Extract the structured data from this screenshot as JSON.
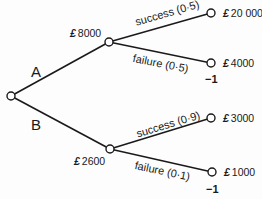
{
  "diagram": {
    "type": "decision-tree",
    "root": {
      "id": "decision",
      "x": 11,
      "y": 96
    },
    "branches": [
      {
        "label": "A",
        "to": "chanceA"
      },
      {
        "label": "B",
        "to": "chanceB"
      }
    ],
    "chance_nodes": [
      {
        "id": "chanceA",
        "x": 109,
        "y": 42,
        "currency": "£",
        "value": "8000"
      },
      {
        "id": "chanceB",
        "x": 110,
        "y": 149,
        "currency": "£",
        "value": "2600"
      }
    ],
    "outcomes": [
      {
        "from": "chanceA",
        "label": "success (0·5)",
        "x": 211,
        "y": 13,
        "currency": "£",
        "value": "20 000",
        "note": ""
      },
      {
        "from": "chanceA",
        "label": "failure (0·5)",
        "x": 211,
        "y": 63,
        "currency": "£",
        "value": "4000",
        "note": "−1"
      },
      {
        "from": "chanceB",
        "label": "success (0·9)",
        "x": 211,
        "y": 118,
        "currency": "£",
        "value": "3000",
        "note": ""
      },
      {
        "from": "chanceB",
        "label": "failure (0·1)",
        "x": 212,
        "y": 172,
        "currency": "£",
        "value": "1000",
        "note": "−1"
      }
    ]
  }
}
